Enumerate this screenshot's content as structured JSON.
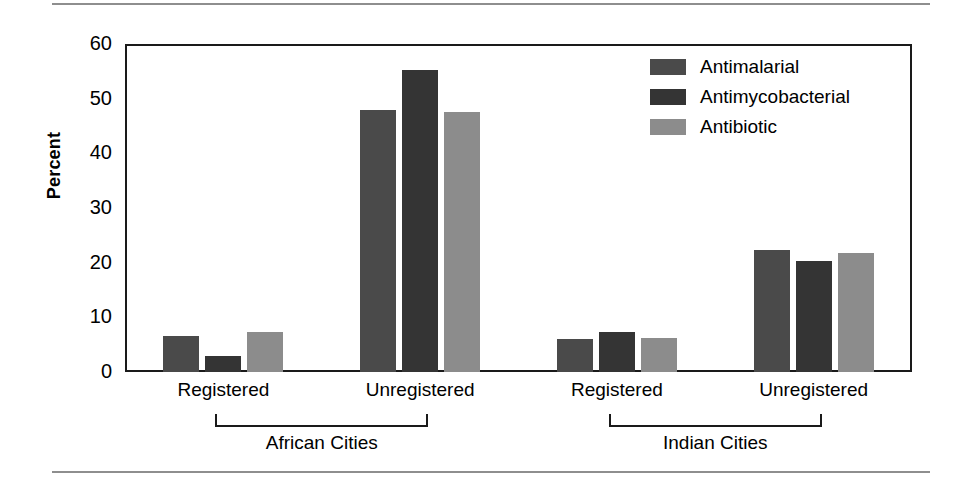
{
  "chart_data": {
    "type": "bar",
    "title": "",
    "xlabel": "",
    "ylabel": "Percent",
    "ylim": [
      0,
      60
    ],
    "yticks": [
      0,
      10,
      20,
      30,
      40,
      50,
      60
    ],
    "grid": false,
    "legend_position": "top-right",
    "categories": [
      "Registered",
      "Unregistered",
      "Registered",
      "Unregistered"
    ],
    "group_brackets": [
      {
        "label": "African Cities",
        "categories": [
          0,
          1
        ]
      },
      {
        "label": "Indian Cities",
        "categories": [
          2,
          3
        ]
      }
    ],
    "series": [
      {
        "name": "Antimalarial",
        "color": "#4a4a4a",
        "values": [
          6.5,
          47.9,
          6.1,
          22.3
        ]
      },
      {
        "name": "Antimycobacterial",
        "color": "#343434",
        "values": [
          3.0,
          55.3,
          7.4,
          20.3
        ]
      },
      {
        "name": "Antibiotic",
        "color": "#8c8c8c",
        "values": [
          7.4,
          47.5,
          6.2,
          21.8
        ]
      }
    ]
  },
  "axis": {
    "y_title": "Percent",
    "tick_labels": [
      "60",
      "50",
      "40",
      "30",
      "20",
      "10",
      "0"
    ]
  },
  "legend": {
    "items": [
      {
        "label": "Antimalarial",
        "color": "#4a4a4a"
      },
      {
        "label": "Antimycobacterial",
        "color": "#343434"
      },
      {
        "label": "Antibiotic",
        "color": "#8c8c8c"
      }
    ]
  },
  "x_labels": [
    "Registered",
    "Unregistered",
    "Registered",
    "Unregistered"
  ],
  "region_labels": [
    "African Cities",
    "Indian Cities"
  ],
  "colors": {
    "frame": "#1a1a1a",
    "rule": "#8e8e8e",
    "background": "#ffffff",
    "antimalarial": "#4a4a4a",
    "antimycobacterial": "#343434",
    "antibiotic": "#8c8c8c"
  }
}
